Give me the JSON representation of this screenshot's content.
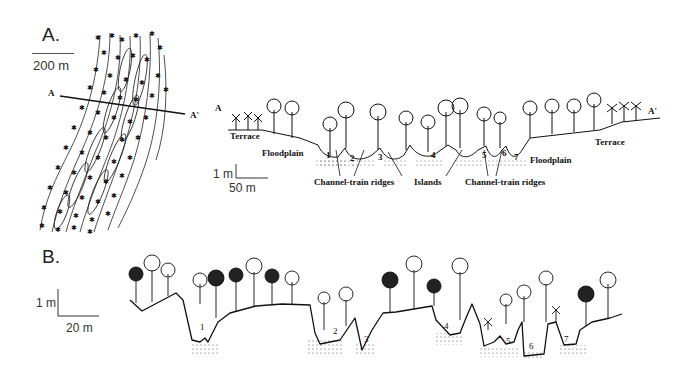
{
  "panel_a": {
    "letter": "A.",
    "map_scale_label": "200 m",
    "transect_start": "A",
    "transect_end": "A'",
    "profile": {
      "start_label": "A",
      "end_label": "A'",
      "vertical_scale": "1 m",
      "horizontal_scale": "50 m",
      "labels": {
        "terrace_left": "Terrace",
        "floodplain_left": "Floodplain",
        "channel_train_ridges_left": "Channel-train ridges",
        "islands": "Islands",
        "channel_train_ridges_right": "Channel-train ridges",
        "floodplain_right": "Floodplain",
        "terrace_right": "Terrace"
      },
      "channel_numbers": [
        "1",
        "2",
        "3",
        "4",
        "5",
        "6",
        "7"
      ]
    }
  },
  "panel_b": {
    "letter": "B.",
    "vertical_scale": "1 m",
    "horizontal_scale": "20 m",
    "channel_numbers": [
      "1",
      "2",
      "3",
      "4",
      "5",
      "6",
      "7"
    ]
  }
}
